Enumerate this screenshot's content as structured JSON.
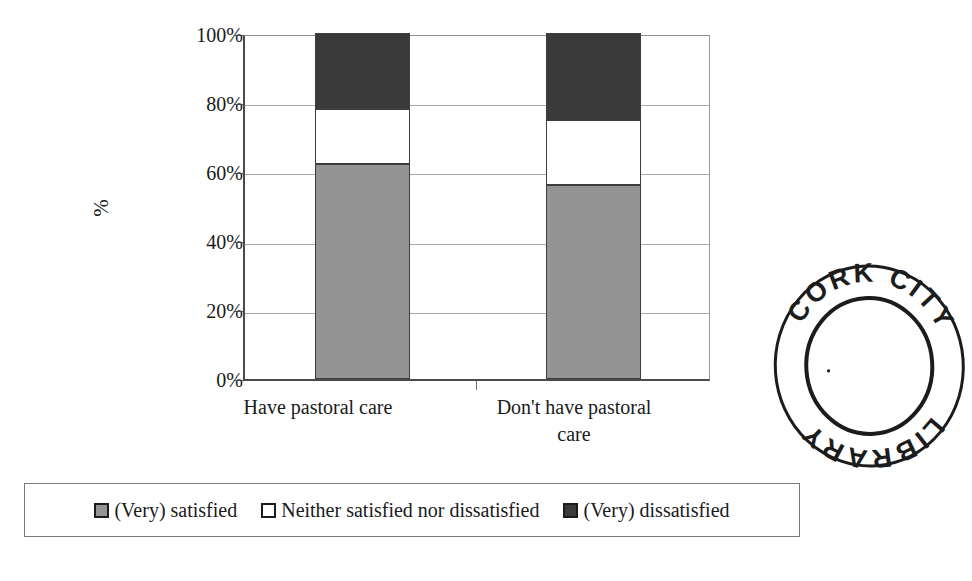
{
  "page": {
    "clipped_top_text": "",
    "background_color": "#ffffff"
  },
  "chart_data": {
    "type": "bar",
    "subtype": "stacked-100-percent",
    "title": "",
    "xlabel": "",
    "ylabel": "%",
    "categories": [
      "Have pastoral care",
      "Don't have pastoral care"
    ],
    "series": [
      {
        "name": "(Very) satisfied",
        "color": "#949494",
        "values": [
          62,
          56
        ]
      },
      {
        "name": "Neither satisfied nor dissatisfied",
        "color": "#ffffff",
        "values": [
          16,
          19
        ]
      },
      {
        "name": "(Very) dissatisfied",
        "color": "#3a3a3a",
        "values": [
          22,
          25
        ]
      }
    ],
    "ylim": [
      0,
      100
    ],
    "ytick_labels": [
      "100%",
      "80%",
      "60%",
      "40%",
      "20%",
      "0%"
    ],
    "ytick_values": [
      100,
      80,
      60,
      40,
      20,
      0
    ],
    "grid": true,
    "grid_axis": "y",
    "legend_position": "bottom",
    "stack_tops": {
      "Have pastoral care": {
        "satisfied_top": 62,
        "neither_top": 78,
        "dissatisfied_top": 100
      },
      "Don't have pastoral care": {
        "satisfied_top": 56,
        "neither_top": 75,
        "dissatisfied_top": 100
      }
    }
  },
  "axis": {
    "y_title": "%",
    "ticks": [
      {
        "label": "100%",
        "value": 100
      },
      {
        "label": "80%",
        "value": 80
      },
      {
        "label": "60%",
        "value": 60
      },
      {
        "label": "40%",
        "value": 40
      },
      {
        "label": "20%",
        "value": 20
      },
      {
        "label": "0%",
        "value": 0
      }
    ],
    "categories": [
      {
        "label": "Have pastoral care"
      },
      {
        "label": "Don't have pastoral care"
      }
    ]
  },
  "legend": {
    "items": [
      {
        "label": "(Very) satisfied",
        "color": "#949494"
      },
      {
        "label": "Neither satisfied nor dissatisfied",
        "color": "#ffffff"
      },
      {
        "label": "(Very) dissatisfied",
        "color": "#3a3a3a"
      }
    ]
  },
  "stamp": {
    "top_text": "CORK CITY",
    "bottom_text": "LIBRARY",
    "word_top": "CORK",
    "word_right": "CITY",
    "word_bottom_left": "LIBRARY",
    "ink_color": "#1c1c1c"
  }
}
